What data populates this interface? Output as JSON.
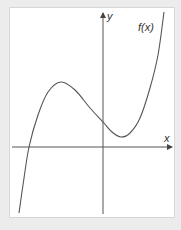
{
  "chart_data": {
    "type": "line",
    "title": "",
    "xlabel": "x",
    "ylabel": "y",
    "function_label": "f(x)",
    "grid": false,
    "ticks": false,
    "series": [
      {
        "name": "f(x)",
        "points_px": [
          [
            19,
            213
          ],
          [
            23,
            185
          ],
          [
            29,
            147
          ],
          [
            38,
            115
          ],
          [
            48,
            92
          ],
          [
            61,
            82
          ],
          [
            75,
            90
          ],
          [
            90,
            108
          ],
          [
            103,
            122
          ],
          [
            112,
            132
          ],
          [
            121,
            137
          ],
          [
            130,
            133
          ],
          [
            140,
            118
          ],
          [
            150,
            88
          ],
          [
            158,
            55
          ],
          [
            164,
            12
          ]
        ]
      }
    ],
    "features": {
      "local_max": "left of y-axis, above x-axis",
      "local_min": "right of y-axis, above x-axis",
      "x_intercepts": 1,
      "y_intercept": "positive"
    }
  },
  "labels": {
    "x_axis": "x",
    "y_axis": "y",
    "curve": "f(x)"
  },
  "colors": {
    "background": "#ececec",
    "panel": "#ffffff",
    "axis": "#444444",
    "curve": "#555555"
  }
}
